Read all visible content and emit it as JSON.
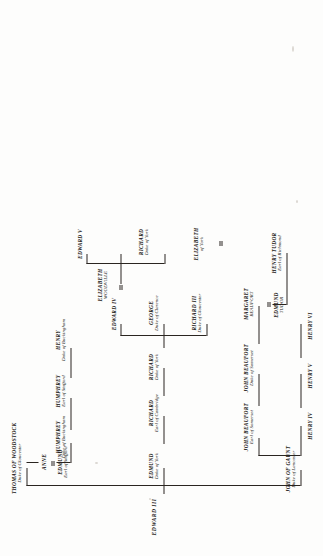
{
  "document": {
    "type": "genealogical-family-tree",
    "orientation": "rotated-90-counterclockwise",
    "root_label": "EDWARD III"
  },
  "people": {
    "edward3": {
      "name": "EDWARD III",
      "title": ""
    },
    "thomas": {
      "name": "THOMAS OF WOODSTOCK",
      "title": "Duke of Gloucester"
    },
    "anne": {
      "name": "ANNE",
      "title": ""
    },
    "edmund_st": {
      "name": "EDMUND",
      "title": "Earl of Stafford"
    },
    "humph_bk": {
      "name": "HUMPHREY",
      "title": "Duke of Buckingham"
    },
    "humph_st": {
      "name": "HUMPHREY",
      "title": "Earl of Stafford"
    },
    "henry_bk": {
      "name": "HENRY",
      "title": "Duke of Buckingham"
    },
    "edmund_yk": {
      "name": "EDMUND",
      "title": "Duke of York"
    },
    "rich_cam": {
      "name": "RICHARD",
      "title": "Earl of Cambridge"
    },
    "rich_yk": {
      "name": "RICHARD",
      "title": "Duke of York"
    },
    "edward4": {
      "name": "EDWARD IV",
      "title": ""
    },
    "george": {
      "name": "GEORGE",
      "title": "Duke of Clarence"
    },
    "richard3": {
      "name": "RICHARD III",
      "title": "Duke of Gloucester"
    },
    "eliz_wood": {
      "name": "ELIZABETH",
      "title": "WOODVILLE"
    },
    "edward5": {
      "name": "EDWARD V",
      "title": ""
    },
    "eliz_york": {
      "name": "ELIZABETH",
      "title": "of York"
    },
    "rich_yk2": {
      "name": "RICHARD",
      "title": "Duke of York"
    },
    "gaunt": {
      "name": "JOHN OF GAUNT",
      "title": "Duke of Lancaster"
    },
    "jb_som_e": {
      "name": "JOHN BEAUFORT",
      "title": "Earl of Somerset"
    },
    "jb_som_d": {
      "name": "JOHN BEAUFORT",
      "title": "Duke of Somerset"
    },
    "marg_bf": {
      "name": "MARGARET",
      "title": "BEAUFORT"
    },
    "edm_tudor": {
      "name": "EDMUND",
      "title": "TUDOR"
    },
    "hen_tudor": {
      "name": "HENRY TUDOR",
      "title": "Earl of Richmond"
    },
    "henry4": {
      "name": "HENRY IV",
      "title": ""
    },
    "henry5": {
      "name": "HENRY V",
      "title": ""
    },
    "henry6": {
      "name": "HENRY VI",
      "title": ""
    }
  },
  "marriages": [
    {
      "left": "thomas",
      "right": "anne",
      "spouse_of_anne": "edmund_st"
    },
    {
      "left": "eliz_wood",
      "right": "edward4"
    },
    {
      "left": "marg_bf",
      "right": "edm_tudor"
    },
    {
      "left": "hen_tudor",
      "right": "eliz_york"
    }
  ],
  "colors": {
    "ink": "#15120f",
    "line": "#2a2520",
    "paper": "#fdfdfc"
  }
}
